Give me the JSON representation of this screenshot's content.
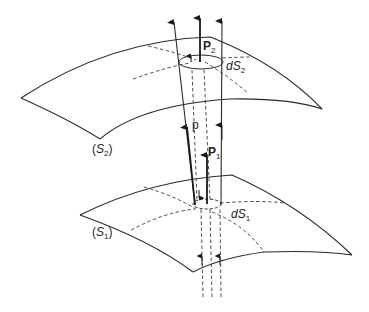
{
  "figure": {
    "labels": {
      "P2": {
        "main": "P",
        "sub": "2"
      },
      "dS2": {
        "main": "dS",
        "sub": "2"
      },
      "p": {
        "main": "p"
      },
      "P1": {
        "main": "P",
        "sub": "1"
      },
      "dS1": {
        "main": "dS",
        "sub": "1"
      },
      "S2": {
        "open": "(",
        "main": "S",
        "sub": "2",
        "close": ")"
      },
      "S1": {
        "open": "(",
        "main": "S",
        "sub": "1",
        "close": ")"
      }
    },
    "colors": {
      "stroke": "#2a2a2a",
      "background": "#ffffff"
    }
  }
}
